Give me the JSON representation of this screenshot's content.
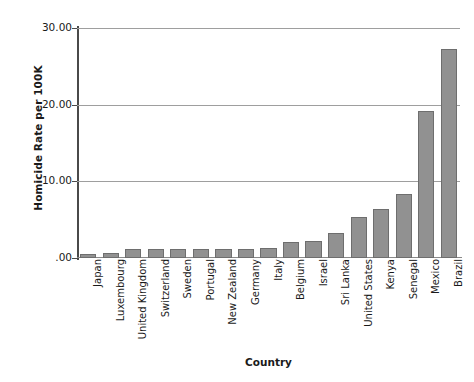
{
  "chart_data": {
    "type": "bar",
    "title": "",
    "xlabel": "Country",
    "ylabel": "Homicide Rate per 100K",
    "ylim": [
      0,
      30
    ],
    "grid": true,
    "legend": false,
    "orientation": "vertical",
    "bar_color": "#919191",
    "bar_edge_color": "#6e6e6e",
    "ytick_labels": [
      "30.00",
      "20.00",
      "10.00",
      ".00"
    ],
    "ytick_values": [
      30,
      20,
      10,
      0
    ],
    "categories": [
      "Japan",
      "Luxembourg",
      "United Kingdom",
      "Switzerland",
      "Sweden",
      "Portugal",
      "New Zealand",
      "Germany",
      "Italy",
      "Belgium",
      "Israel",
      "Sri Lanka",
      "United States",
      "Kenya",
      "Senegal",
      "Mexico",
      "Brazil"
    ],
    "values": [
      0.5,
      0.6,
      1.2,
      1.2,
      1.2,
      1.2,
      1.2,
      1.2,
      1.3,
      2.1,
      2.2,
      3.2,
      5.3,
      6.4,
      8.3,
      19.2,
      27.2
    ]
  }
}
